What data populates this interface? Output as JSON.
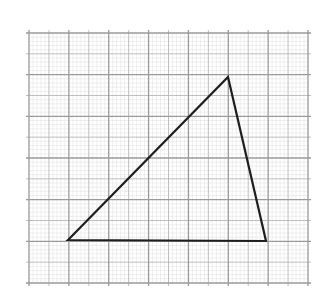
{
  "diagram": {
    "type": "triangle-on-graph-paper",
    "background_color": "#ffffff",
    "grid": {
      "x_start": 29,
      "x_end": 308,
      "y_start": 33,
      "y_end": 283,
      "cols": 14,
      "rows": 12,
      "minor_subdivisions": 5,
      "major_every_cols": 2,
      "major_color": "#9a9a9a",
      "medium_color": "#b8b8b8",
      "minor_color": "#e4e4e4"
    },
    "triangle": {
      "stroke_color": "#1e1e1e",
      "stroke_width": 2.2,
      "vertices": [
        {
          "name": "bottom-left",
          "x": 68,
          "y": 240
        },
        {
          "name": "top",
          "x": 228,
          "y": 77
        },
        {
          "name": "bottom-right",
          "x": 266,
          "y": 241
        }
      ]
    }
  }
}
